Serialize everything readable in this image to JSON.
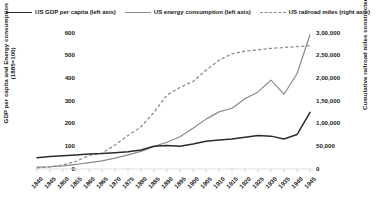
{
  "chart_data": {
    "type": "line",
    "title": "",
    "xlabel": "",
    "ylabel": "GDP per capita and Energy consumption (1885=100)",
    "y2label": "Cumulative railroad miles constructed",
    "grid": false,
    "legend_position": "top",
    "ylim": [
      0,
      600
    ],
    "y2lim": [
      0,
      300000
    ],
    "yticks": [
      "0",
      "100",
      "200",
      "300",
      "400",
      "500",
      "600"
    ],
    "y2ticks": [
      "0",
      "50,000",
      "1,00,000",
      "1,50,000",
      "2,00,000",
      "2,50,000",
      "3,00,000"
    ],
    "x": [
      1840,
      1845,
      1850,
      1855,
      1860,
      1865,
      1870,
      1875,
      1880,
      1885,
      1890,
      1895,
      1900,
      1905,
      1910,
      1915,
      1920,
      1925,
      1930,
      1935,
      1940,
      1945
    ],
    "xticks": [
      "1840",
      "1845",
      "1850",
      "1855",
      "1860",
      "1865",
      "1870",
      "1875",
      "1880",
      "1885",
      "1890",
      "1895",
      "1900",
      "1905",
      "1910",
      "1915",
      "1920",
      "1925",
      "1930",
      "1935",
      "1940",
      "1945"
    ],
    "series": [
      {
        "name": "US GDP per capita (left axis)",
        "axis": "left",
        "style": "solid",
        "color": "#2b2b2b",
        "values": [
          50,
          55,
          58,
          62,
          66,
          68,
          72,
          76,
          84,
          100,
          104,
          100,
          110,
          122,
          128,
          132,
          140,
          148,
          145,
          132,
          152,
          250
        ]
      },
      {
        "name": "US energy consumption (left axis)",
        "axis": "left",
        "style": "solid",
        "color": "#8a8a8a",
        "values": [
          8,
          10,
          14,
          20,
          28,
          36,
          48,
          62,
          78,
          100,
          118,
          142,
          180,
          220,
          252,
          268,
          310,
          340,
          392,
          330,
          420,
          592
        ]
      },
      {
        "name": "US railroad miles (right axis)",
        "axis": "right",
        "style": "dashed",
        "color": "#8e8e8e",
        "values": [
          2800,
          4600,
          9000,
          17000,
          30000,
          35000,
          53000,
          74000,
          93000,
          125000,
          163000,
          180000,
          193000,
          218000,
          240000,
          254000,
          260000,
          263000,
          266000,
          268000,
          270000,
          272000
        ]
      }
    ]
  },
  "legend": {
    "items": [
      {
        "label": "US GDP per capita (left axis)",
        "marker": "solid-dark-line-icon"
      },
      {
        "label": "US energy consumption (left axis)",
        "marker": "solid-gray-line-icon"
      },
      {
        "label": "US railroad miles (right axis)",
        "marker": "dashed-gray-line-icon"
      }
    ]
  }
}
